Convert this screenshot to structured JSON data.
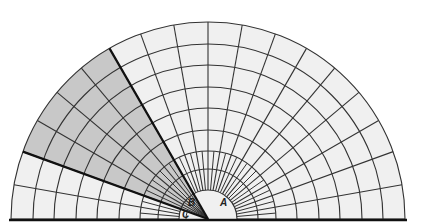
{
  "diagram": {
    "type": "polar-grid-semicircle",
    "center": [
      208,
      219
    ],
    "outer_radius": 197,
    "inner_radius": 29,
    "ring_radii": [
      29,
      50,
      68,
      89,
      111,
      132,
      154,
      175,
      197
    ],
    "spoke_step_deg": 10,
    "inner_spoke_step_deg": 5,
    "inner_spoke_outer_radius": 68,
    "shaded_wedge": {
      "start_deg": 120,
      "end_deg": 160
    },
    "colors": {
      "grid_fill": "#f0f0f0",
      "shaded_fill": "#c8c8c8",
      "line": "#333333",
      "bold_line": "#111111",
      "background": "#ffffff"
    },
    "labels": [
      {
        "id": "A",
        "text": "A",
        "x": 220,
        "y": 206
      },
      {
        "id": "B",
        "text": "B",
        "x": 188,
        "y": 206
      },
      {
        "id": "C",
        "text": "C",
        "x": 182,
        "y": 218
      }
    ]
  }
}
